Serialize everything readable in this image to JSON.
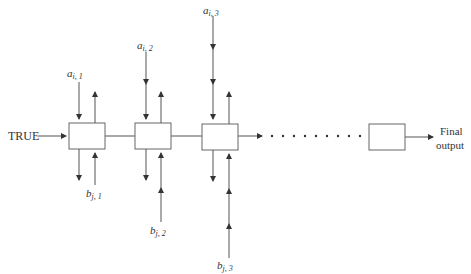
{
  "diagram": {
    "input_label": "TRUE",
    "output_label_line1": "Final",
    "output_label_line2": "output",
    "stages": [
      {
        "a_var": "a",
        "a_sub": "i, 1",
        "b_var": "b",
        "b_sub": "j, 1"
      },
      {
        "a_var": "a",
        "a_sub": "i, 2",
        "b_var": "b",
        "b_sub": "j, 2"
      },
      {
        "a_var": "a",
        "a_sub": "i, 3",
        "b_var": "b",
        "b_sub": "j, 3"
      }
    ],
    "ellipsis": "dotted continuation",
    "colors": {
      "line": "#555555",
      "box_border": "#666666",
      "text": "#333333"
    }
  }
}
